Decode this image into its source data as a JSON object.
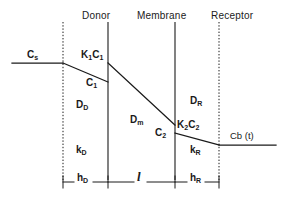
{
  "figure": {
    "background_color": "#ffffff",
    "line_color": "#1a1a1a",
    "text_color": "#1a1a1a"
  },
  "regions": [
    {
      "id": "donor",
      "label": "Donor",
      "x": 82,
      "y": 10
    },
    {
      "id": "membrane",
      "label": "Membrane",
      "x": 140,
      "y": 10
    },
    {
      "id": "receptor",
      "label": "Receptor",
      "x": 213,
      "y": 10
    }
  ],
  "boundaries": [
    {
      "id": "donor-bulk-boundary",
      "x": 63,
      "style": "dotted",
      "y1": 22,
      "y2": 180
    },
    {
      "id": "donor-membrane-surface",
      "x": 108,
      "style": "solid",
      "y1": 22,
      "y2": 180
    },
    {
      "id": "membrane-receptor-surface",
      "x": 175,
      "style": "solid",
      "y1": 22,
      "y2": 180
    },
    {
      "id": "receptor-bulk-boundary",
      "x": 219,
      "style": "dotted",
      "y1": 22,
      "y2": 180
    }
  ],
  "profile": {
    "description": "Solute concentration falling from donor bulk through membrane to receptor bulk",
    "segments": [
      {
        "id": "donor-bulk",
        "x1": 12,
        "y1": 63,
        "x2": 63,
        "y2": 63
      },
      {
        "id": "donor-boundary-layer",
        "x1": 63,
        "y1": 63,
        "x2": 108,
        "y2": 82
      },
      {
        "id": "membrane-interior",
        "x1": 108,
        "y1": 63,
        "x2": 175,
        "y2": 125
      },
      {
        "id": "receptor-boundary-layer",
        "x1": 175,
        "y1": 133,
        "x2": 219,
        "y2": 145
      },
      {
        "id": "receptor-bulk",
        "x1": 219,
        "y1": 145,
        "x2": 276,
        "y2": 145
      }
    ],
    "interface-jumps": [
      {
        "id": "donor-interface-jump",
        "x": 108,
        "y_outer": 82,
        "y_inner": 63
      },
      {
        "id": "receptor-interface-jump",
        "x": 175,
        "y_inner": 125,
        "y_outer": 133
      }
    ]
  },
  "concentration_labels": [
    {
      "id": "cs",
      "text": "C",
      "sub": "s",
      "x": 28,
      "y": 50
    },
    {
      "id": "k1c1",
      "text": "K",
      "sub": "1",
      "text2": "C",
      "sub2": "1",
      "x": 82,
      "y": 50
    },
    {
      "id": "c1",
      "text": "C",
      "sub": "1",
      "x": 86,
      "y": 78
    },
    {
      "id": "k2c2",
      "text": "K",
      "sub": "2",
      "text2": "C",
      "sub2": "2",
      "x": 178,
      "y": 120
    },
    {
      "id": "c2",
      "text": "C",
      "sub": "2",
      "x": 155,
      "y": 128
    }
  ],
  "diffusion_labels": [
    {
      "id": "dd",
      "text": "D",
      "sub": "D",
      "x": 76,
      "y": 100
    },
    {
      "id": "dm",
      "text": "D",
      "sub": "m",
      "x": 130,
      "y": 115
    },
    {
      "id": "dr",
      "text": "D",
      "sub": "R",
      "x": 190,
      "y": 96
    }
  ],
  "transfer_labels": [
    {
      "id": "kd",
      "text": "k",
      "sub": "D",
      "x": 76,
      "y": 145
    },
    {
      "id": "kr",
      "text": "k",
      "sub": "R",
      "x": 190,
      "y": 145
    }
  ],
  "bulk_receptor_label": {
    "id": "cbt",
    "text": "Cb (t)",
    "x": 230,
    "y": 131
  },
  "dimensions": [
    {
      "id": "hd",
      "text": "h",
      "sub": "D",
      "x": 78,
      "y": 173,
      "x1": 63,
      "x2": 108,
      "axis_y": 182
    },
    {
      "id": "l",
      "text": "l",
      "x": 138,
      "y": 170,
      "x1": 108,
      "x2": 175,
      "axis_y": 182
    },
    {
      "id": "hr",
      "text": "h",
      "sub": "R",
      "x": 190,
      "y": 173,
      "x1": 175,
      "x2": 219,
      "axis_y": 182
    }
  ]
}
